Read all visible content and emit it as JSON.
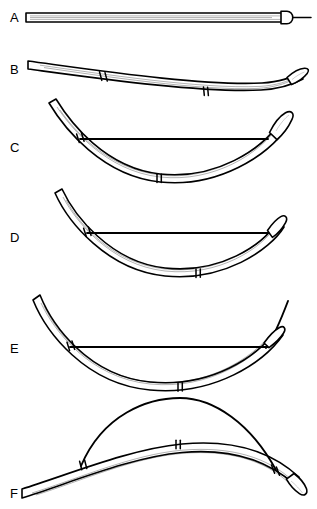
{
  "figure": {
    "background_color": "#ffffff",
    "ink_color": "#000000",
    "width": 317,
    "height": 509,
    "panel_count": 6
  },
  "panels": [
    {
      "id": "A",
      "label": "A",
      "label_x": 10,
      "label_y": 22,
      "caption": "straight catheter shaft with protruding guide wire",
      "shape": "straight",
      "marker_bands": 0,
      "has_tension_chord": false,
      "has_protruding_wire": true,
      "deflection_percent": 0
    },
    {
      "id": "B",
      "label": "B",
      "label_x": 10,
      "label_y": 74,
      "caption": "slightly curved shaft, two marker bands visible",
      "shape": "slight-curve",
      "marker_bands": 2,
      "has_tension_chord": false,
      "has_protruding_wire": false,
      "deflection_percent": 15
    },
    {
      "id": "C",
      "label": "C",
      "label_x": 10,
      "label_y": 152,
      "caption": "concave arc with taut chord spanning both marker bands",
      "shape": "concave-arc",
      "marker_bands": 2,
      "has_tension_chord": true,
      "has_protruding_wire": false,
      "deflection_percent": 45
    },
    {
      "id": "D",
      "label": "D",
      "label_x": 10,
      "label_y": 242,
      "caption": "deeper concave arc, chord shortened",
      "shape": "concave-arc-deeper",
      "marker_bands": 2,
      "has_tension_chord": true,
      "has_protruding_wire": false,
      "deflection_percent": 60
    },
    {
      "id": "E",
      "label": "E",
      "label_x": 10,
      "label_y": 353,
      "caption": "maximal concave deflection with distal tip curling upward",
      "shape": "concave-arc-max",
      "marker_bands": 2,
      "has_tension_chord": true,
      "has_protruding_wire": false,
      "deflection_percent": 80
    },
    {
      "id": "F",
      "label": "F",
      "label_x": 10,
      "label_y": 498,
      "caption": "reversed convex curve with wire bowed above the shaft",
      "shape": "convex-arc",
      "marker_bands": 2,
      "has_tension_chord": true,
      "has_protruding_wire": false,
      "deflection_percent": -70
    }
  ],
  "geometry": {
    "panel_a": {
      "shaft_top": "M 26 13 L 284 13",
      "shaft_bottom": "M 26 22 L 284 22",
      "shaft_left_cap": "M 26 13 L 26 22",
      "tip_cap": "M 284 11.5 L 289 11.5 A 5.2 5.8 0 0 1 289 23.5 L 284 23.5 Z",
      "lumen_upper": "M 30 16.2 L 281 16.2",
      "lumen_lower": "M 30 19.3 L 281 19.3",
      "protruding_wire": "M 294 17.3 L 311 17.3"
    },
    "panel_b": {
      "outer": "M 28 61 C 95 70, 200 86, 262 83 C 278 82, 292 78, 301 73",
      "inner": "M 28 69 C 95 78, 200 93, 261 90 C 277 89, 291 85, 300 80",
      "lumen": "M 40 65.4 C 100 74, 200 89.5, 260 86.6 C 276 85.6, 289 81.8, 297 77",
      "band1_a": "M 99.5 72.2 L 101.7 80.6",
      "band1_b": "M 104.5 72.9 L 106.7 81.2",
      "band2_a": "M 203.5 87.4 L 204.2 95.6",
      "band2_b": "M 207.3 87.5 L 208 95.7",
      "tip_cap": "M 288 76.5 C 294 71.5, 300 68.5, 304.5 68.2 C 308 68, 309.5 70.2, 307.5 73 C 305 76.5, 298 81.3, 292 83.8 Z"
    },
    "panel_c": {
      "outer": "M 56 99 C 70 122, 105 168, 160 174 C 215 180, 262 150, 281 121",
      "inner": "M 49 103 C 64 128, 102 176, 160 182 C 218 188, 268 155, 287 126",
      "lumen": "M 56 108 C 70 129, 106 172, 160 178 C 214 184, 262 153, 280 126",
      "chord": "M 80 139 L 268 139",
      "band_left_a": "M 76.5 134.2 L 79.2 142.6",
      "band_left_b": "M 81.2 133.1 L 83.8 141.5",
      "band_bottom_a": "M 157 174.5 L 157 182.6",
      "band_bottom_b": "M 161 174.6 L 161 182.7",
      "tip_cap": "M 270 131 C 275 123, 281 116, 286 113 C 291 110, 295 113, 292 119 C 289 126, 283 134, 277 139 Z"
    },
    "panel_d": {
      "outer": "M 62 189 C 74 215, 110 262, 165 268 C 220 274, 263 245, 277 222",
      "inner": "M 55 193 C 68 222, 107 270, 165 276 C 223 282, 270 250, 284 227",
      "lumen": "M 62 199 C 75 224, 110 266, 165 272 C 220 278, 263 249, 277 227",
      "chord": "M 87 233 L 272 233",
      "band_left_a": "M 83.5 228.3 L 86.2 236.7",
      "band_left_b": "M 88.2 227.2 L 90.8 235.6",
      "band_bottom_a": "M 196 269.4 L 196 277.6",
      "band_bottom_b": "M 200 269.3 L 200 277.5",
      "tip_cap": "M 268 229 C 272 224, 277 219, 281 217 C 285 215, 288 218, 285 223 C 282 228, 277 234, 272 237 Z"
    },
    "panel_e": {
      "outer": "M 40 295 C 52 325, 88 376, 150 382 C 212 388, 262 355, 288 306",
      "inner": "M 33 300 C 46 332, 85 384, 150 390 C 215 396, 268 361, 295 312",
      "lumen": "M 40 306 C 53 334, 89 379, 150 385 C 211 391, 262 359, 288 312",
      "chord": "M 70 347 L 268 347",
      "band_left_a": "M 67 342.3 L 69.5 350.7",
      "band_left_b": "M 72 341.2 L 74.5 349.6",
      "band_bottom_a": "M 178 383.2 L 178 391.4",
      "band_bottom_b": "M 182 383.1 L 182 391.3",
      "tip_curl": "M 268 347 C 272 339, 276 330, 281 321"
    },
    "panel_f": {
      "outer": "M 24 489 C 70 474, 130 449, 182 444 C 234 439, 272 452, 300 478",
      "inner": "M 24 498 C 70 483, 130 457, 182 452 C 234 447, 274 460, 303 487",
      "lumen": "M 34 494 C 76 480, 132 455, 182 450.5 C 232 446, 270 458, 296 482",
      "bow_wire": "M 82 466 C 105 415, 150 399, 180 399 C 215 399, 252 425, 276 470",
      "band_left_a": "M 80 461.5 L 82 470",
      "band_left_b": "M 85 460.5 L 87 469",
      "band_mid_a": "M 176 440.6 L 176 449",
      "band_mid_b": "M 180 440.5 L 180 448.9",
      "band_right_a": "M 272 465.5 L 275 473.5",
      "band_right_b": "M 277 467.2 L 280 475.2",
      "tip_cap": "M 296 474 C 301 478, 306 484, 307.5 489 C 309 494, 305 497, 300 494 C 295 491, 290 485, 287 480 Z"
    }
  }
}
